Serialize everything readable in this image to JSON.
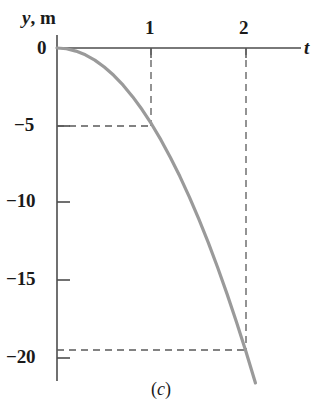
{
  "figure": {
    "caption_prefix": "(",
    "caption_letter": "c",
    "caption_suffix": ")",
    "caption": "(c)"
  },
  "axes": {
    "y_axis_label_symbol": "y",
    "y_axis_label_separator": ", ",
    "y_axis_label_unit": "m",
    "y_axis_label": "y, m",
    "x_axis_label": "t",
    "origin_label": "0",
    "curve_color": "#9a9a9a",
    "axis_color": "#4d4d4d",
    "dash_color": "#5a5a5a",
    "text_color": "#1a1a1a"
  },
  "ticks": {
    "x_labels": [
      "1",
      "2"
    ],
    "y_labels": [
      "−5",
      "−10",
      "−15",
      "−20"
    ]
  },
  "chart_data": {
    "type": "line",
    "title": "",
    "subtitle": "",
    "xlabel": "t",
    "ylabel": "y, m",
    "xlim": [
      0,
      2.4
    ],
    "ylim": [
      -22.5,
      1
    ],
    "xticks": [
      1,
      2
    ],
    "xticklabels": [
      "1",
      "2"
    ],
    "yticks": [
      -5,
      -10,
      -15,
      -20
    ],
    "yticklabels": [
      "−5",
      "−10",
      "−15",
      "−20"
    ],
    "grid": false,
    "legend": null,
    "series": [
      {
        "name": "y = −4.9 t²",
        "color": "#9a9a9a",
        "x": [
          0,
          0.1,
          0.2,
          0.3,
          0.4,
          0.5,
          0.6,
          0.7,
          0.8,
          0.9,
          1.0,
          1.1,
          1.2,
          1.3,
          1.4,
          1.5,
          1.6,
          1.7,
          1.8,
          1.9,
          2.0,
          2.1,
          2.2
        ],
        "values": [
          0,
          -0.05,
          -0.2,
          -0.44,
          -0.78,
          -1.23,
          -1.76,
          -2.4,
          -3.14,
          -3.97,
          -4.9,
          -5.93,
          -7.06,
          -8.28,
          -9.6,
          -11.03,
          -12.54,
          -14.16,
          -15.88,
          -17.69,
          -19.6,
          -21.61,
          -23.72
        ]
      }
    ],
    "annotations": [
      {
        "kind": "dashed-guide",
        "x": 1,
        "y": -4.9,
        "x_label": "1",
        "y_label": "−5"
      },
      {
        "kind": "dashed-guide",
        "x": 2,
        "y": -19.6,
        "x_label": "2",
        "y_label": "−20"
      }
    ]
  }
}
